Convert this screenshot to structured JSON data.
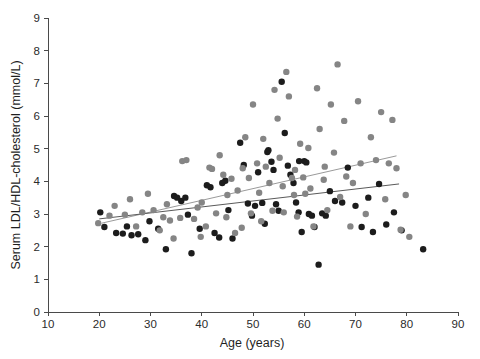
{
  "chart_data": {
    "type": "scatter",
    "title": "",
    "xlabel": "Age (years)",
    "ylabel": "Serum LDL/HDL-cholesterol  (mmol/L)",
    "xlim": [
      10,
      90
    ],
    "ylim": [
      0,
      9
    ],
    "xticks": [
      10,
      20,
      30,
      40,
      50,
      60,
      70,
      80,
      90
    ],
    "yticks": [
      0,
      1,
      2,
      3,
      4,
      5,
      6,
      7,
      8,
      9
    ],
    "xtick_labels": [
      "10",
      "20",
      "30",
      "40",
      "50",
      "60",
      "70",
      "80",
      "90"
    ],
    "ytick_labels": [
      "0",
      "1",
      "2",
      "3",
      "4",
      "5",
      "6",
      "7",
      "8",
      "9"
    ],
    "grid": false,
    "legend": "none",
    "marker_radius_px": 3.2,
    "series": [
      {
        "name": "group-dark",
        "color": "#1c1c1c",
        "points": [
          [
            20.2,
            3.05
          ],
          [
            21.0,
            2.6
          ],
          [
            23.3,
            2.42
          ],
          [
            24.6,
            2.4
          ],
          [
            25.4,
            2.62
          ],
          [
            26.3,
            2.35
          ],
          [
            27.6,
            2.38
          ],
          [
            29.0,
            2.2
          ],
          [
            31.5,
            2.55
          ],
          [
            33.0,
            1.92
          ],
          [
            34.6,
            3.55
          ],
          [
            35.2,
            3.5
          ],
          [
            36.0,
            3.4
          ],
          [
            36.8,
            3.5
          ],
          [
            37.3,
            2.98
          ],
          [
            38.0,
            1.8
          ],
          [
            39.6,
            2.55
          ],
          [
            41.0,
            3.88
          ],
          [
            41.7,
            3.82
          ],
          [
            42.5,
            2.42
          ],
          [
            43.4,
            2.28
          ],
          [
            44.6,
            4.02
          ],
          [
            45.2,
            3.12
          ],
          [
            46.0,
            2.25
          ],
          [
            47.5,
            5.18
          ],
          [
            48.2,
            4.5
          ],
          [
            49.0,
            3.32
          ],
          [
            49.8,
            2.95
          ],
          [
            50.4,
            3.25
          ],
          [
            51.0,
            4.28
          ],
          [
            51.8,
            3.34
          ],
          [
            52.3,
            2.7
          ],
          [
            53.0,
            4.95
          ],
          [
            53.6,
            4.6
          ],
          [
            54.0,
            4.35
          ],
          [
            54.5,
            3.3
          ],
          [
            55.0,
            3.1
          ],
          [
            55.6,
            7.05
          ],
          [
            56.2,
            5.48
          ],
          [
            56.8,
            4.48
          ],
          [
            57.3,
            4.2
          ],
          [
            57.9,
            3.95
          ],
          [
            58.4,
            3.35
          ],
          [
            58.9,
            3.05
          ],
          [
            59.5,
            2.45
          ],
          [
            60.0,
            4.62
          ],
          [
            60.4,
            4.58
          ],
          [
            60.9,
            3.0
          ],
          [
            61.5,
            2.95
          ],
          [
            62.0,
            2.6
          ],
          [
            62.8,
            1.45
          ],
          [
            63.5,
            3.02
          ],
          [
            64.2,
            2.95
          ],
          [
            65.0,
            3.7
          ],
          [
            66.0,
            3.4
          ],
          [
            67.4,
            3.35
          ],
          [
            68.5,
            4.42
          ],
          [
            70.0,
            3.25
          ],
          [
            71.2,
            2.6
          ],
          [
            72.5,
            3.5
          ],
          [
            73.4,
            2.45
          ],
          [
            74.6,
            3.92
          ],
          [
            76.0,
            2.68
          ],
          [
            77.5,
            3.05
          ],
          [
            79.0,
            2.5
          ],
          [
            83.2,
            1.92
          ],
          [
            29.8,
            2.78
          ],
          [
            44.0,
            3.95
          ],
          [
            52.8,
            4.9
          ],
          [
            59.0,
            4.62
          ]
        ]
      },
      {
        "name": "group-gray",
        "color": "#858585",
        "points": [
          [
            19.8,
            2.72
          ],
          [
            22.0,
            2.95
          ],
          [
            23.0,
            3.25
          ],
          [
            25.0,
            2.98
          ],
          [
            26.0,
            3.45
          ],
          [
            27.2,
            2.62
          ],
          [
            28.4,
            3.05
          ],
          [
            29.5,
            3.62
          ],
          [
            30.6,
            3.12
          ],
          [
            31.8,
            2.5
          ],
          [
            32.5,
            2.9
          ],
          [
            33.8,
            2.8
          ],
          [
            34.5,
            2.25
          ],
          [
            35.8,
            2.88
          ],
          [
            37.0,
            4.65
          ],
          [
            38.5,
            2.85
          ],
          [
            39.2,
            3.2
          ],
          [
            40.0,
            3.35
          ],
          [
            40.8,
            2.62
          ],
          [
            41.5,
            4.42
          ],
          [
            42.0,
            4.38
          ],
          [
            42.8,
            3.02
          ],
          [
            43.5,
            4.8
          ],
          [
            44.2,
            4.2
          ],
          [
            45.0,
            3.58
          ],
          [
            45.8,
            4.08
          ],
          [
            46.5,
            2.42
          ],
          [
            47.0,
            3.72
          ],
          [
            47.8,
            2.58
          ],
          [
            48.5,
            5.35
          ],
          [
            49.2,
            4.1
          ],
          [
            49.6,
            3.02
          ],
          [
            50.0,
            6.35
          ],
          [
            50.8,
            4.55
          ],
          [
            51.2,
            3.65
          ],
          [
            51.6,
            2.78
          ],
          [
            52.0,
            5.3
          ],
          [
            52.5,
            4.45
          ],
          [
            53.2,
            3.95
          ],
          [
            53.8,
            3.1
          ],
          [
            54.2,
            6.8
          ],
          [
            54.8,
            5.92
          ],
          [
            55.2,
            4.72
          ],
          [
            55.8,
            3.85
          ],
          [
            56.0,
            3.05
          ],
          [
            56.5,
            7.35
          ],
          [
            57.0,
            6.6
          ],
          [
            57.6,
            4.1
          ],
          [
            58.0,
            3.58
          ],
          [
            58.6,
            2.92
          ],
          [
            59.2,
            5.15
          ],
          [
            59.8,
            4.12
          ],
          [
            60.2,
            3.62
          ],
          [
            60.8,
            5.02
          ],
          [
            61.2,
            3.78
          ],
          [
            61.8,
            2.62
          ],
          [
            62.5,
            6.85
          ],
          [
            63.0,
            5.6
          ],
          [
            63.8,
            4.05
          ],
          [
            64.5,
            3.12
          ],
          [
            65.2,
            6.35
          ],
          [
            65.8,
            4.88
          ],
          [
            66.5,
            7.58
          ],
          [
            67.0,
            3.52
          ],
          [
            67.8,
            5.85
          ],
          [
            68.2,
            4.15
          ],
          [
            69.0,
            2.62
          ],
          [
            70.5,
            6.45
          ],
          [
            71.0,
            4.55
          ],
          [
            72.0,
            3.0
          ],
          [
            73.0,
            5.35
          ],
          [
            74.0,
            4.65
          ],
          [
            75.0,
            6.12
          ],
          [
            75.8,
            3.45
          ],
          [
            76.5,
            4.55
          ],
          [
            77.2,
            5.88
          ],
          [
            78.0,
            4.4
          ],
          [
            78.8,
            2.52
          ],
          [
            79.8,
            3.58
          ],
          [
            80.5,
            2.3
          ],
          [
            36.2,
            4.62
          ],
          [
            48.0,
            4.4
          ],
          [
            58.2,
            4.35
          ],
          [
            64.0,
            4.45
          ],
          [
            69.5,
            3.95
          ],
          [
            44.8,
            2.9
          ],
          [
            39.8,
            2.3
          ],
          [
            33.2,
            3.3
          ]
        ]
      }
    ],
    "trend_lines": [
      {
        "name": "upper-regression-line",
        "color": "#9a9a9a",
        "x_start": 20.5,
        "y_start": 2.72,
        "x_end": 78.0,
        "y_end": 4.78
      },
      {
        "name": "lower-regression-line",
        "color": "#5a5a5a",
        "x_start": 20.0,
        "y_start": 2.85,
        "x_end": 78.5,
        "y_end": 3.92
      }
    ]
  },
  "axes": {
    "x_axis_name": "age-axis",
    "y_axis_name": "cholesterol-axis"
  }
}
